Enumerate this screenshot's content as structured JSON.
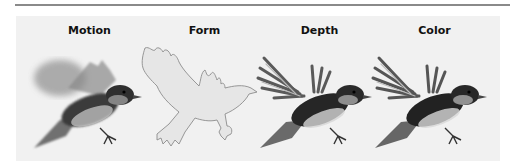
{
  "figure": {
    "panels": [
      {
        "label": "Motion",
        "style": "blurred-photo"
      },
      {
        "label": "Form",
        "style": "outline"
      },
      {
        "label": "Depth",
        "style": "shaded-photo"
      },
      {
        "label": "Color",
        "style": "shaded-photo"
      }
    ]
  },
  "colors": {
    "rule": "#8a8a8a",
    "panel_background": "#f1f1f1",
    "outline_fill": "#e6e6e6",
    "outline_stroke": "#8c8c8c",
    "bird_dark": "#2a2a2a",
    "bird_mid": "#777777",
    "bird_light": "#bdbdbd"
  }
}
